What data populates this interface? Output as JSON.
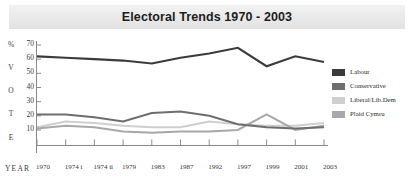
{
  "title": "Electoral Trends 1970 - 2003",
  "axes": {
    "y_axis_word_letters": [
      "%",
      "V",
      "O",
      "T",
      "E"
    ],
    "year_label": "YEAR"
  },
  "legend": {
    "position": "right",
    "items": [
      {
        "label": "Labour",
        "color": "#3b3b3b"
      },
      {
        "label": "Conservative",
        "color": "#6e6e6e"
      },
      {
        "label": "Liberal/Lib.Dem",
        "color": "#cfcfcf"
      },
      {
        "label": "Plaid Cymru",
        "color": "#a8a8a8"
      }
    ]
  },
  "chart_data": {
    "type": "line",
    "title": "Electoral Trends 1970 - 2003",
    "xlabel": "YEAR",
    "ylabel": "% VOTE",
    "grid": true,
    "legend_position": "right",
    "ylim": [
      0,
      75
    ],
    "yticks": [
      70,
      60,
      50,
      40,
      30,
      20,
      10
    ],
    "categories": [
      "1970",
      "1974 i",
      "1974 ii",
      "1979",
      "1983",
      "1987",
      "1992",
      "1997",
      "1999",
      "2001",
      "2003"
    ],
    "series": [
      {
        "name": "Labour",
        "color": "#3b3b3b",
        "values": [
          62,
          61,
          60,
          59,
          57,
          61,
          64,
          68,
          55,
          62,
          58
        ]
      },
      {
        "name": "Conservative",
        "color": "#6e6e6e",
        "values": [
          21,
          21,
          19,
          16,
          22,
          23,
          20,
          14,
          12,
          11,
          12
        ]
      },
      {
        "name": "Liberal/Lib.Dem",
        "color": "#cfcfcf",
        "values": [
          12,
          16,
          15,
          13,
          12,
          12,
          16,
          14,
          13,
          13,
          15
        ]
      },
      {
        "name": "Plaid Cymru",
        "color": "#a8a8a8",
        "values": [
          11,
          13,
          12,
          9,
          8,
          9,
          9,
          10,
          21,
          10,
          13
        ]
      }
    ]
  }
}
